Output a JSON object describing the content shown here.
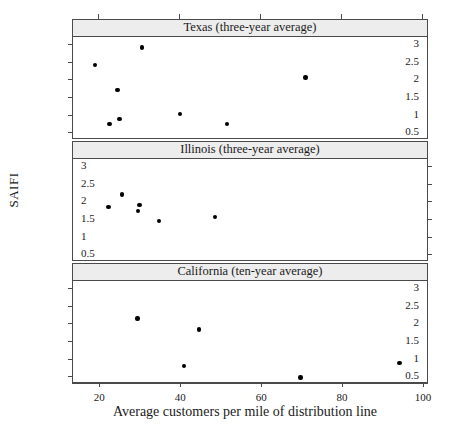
{
  "figure": {
    "ylabel": "SAIFI",
    "xlabel": "Average customers per mile of distribution line"
  },
  "chart_data": {
    "type": "scatter",
    "title": "",
    "xlabel": "Average customers per mile of distribution line",
    "ylabel": "SAIFI",
    "xlim": [
      13.5,
      101
    ],
    "ylim": [
      0.28,
      3.2
    ],
    "xticks": [
      20,
      40,
      60,
      80,
      100
    ],
    "yticks": [
      0.5,
      1,
      1.5,
      2,
      2.5,
      3
    ],
    "xtick_labels": [
      "20",
      "40",
      "60",
      "80",
      "100"
    ],
    "ytick_labels": [
      "0.5",
      "1",
      "1.5",
      "2",
      "2.5",
      "3"
    ],
    "grid": false,
    "legend": null,
    "marker": "filled-circle",
    "marker_color": "#000000",
    "layout": "trellis-3-rows-1-col",
    "panels": [
      {
        "label": "Texas (three-year average)",
        "axis_side": "left",
        "points": [
          {
            "x": 19.0,
            "y": 2.41
          },
          {
            "x": 22.5,
            "y": 0.73
          },
          {
            "x": 24.5,
            "y": 1.69
          },
          {
            "x": 25.0,
            "y": 0.87
          },
          {
            "x": 30.5,
            "y": 2.9
          },
          {
            "x": 40.0,
            "y": 1.02
          },
          {
            "x": 51.5,
            "y": 0.74
          },
          {
            "x": 71.0,
            "y": 2.05
          }
        ]
      },
      {
        "label": "Illinois (three-year average)",
        "axis_side": "right",
        "points": [
          {
            "x": 22.3,
            "y": 1.84
          },
          {
            "x": 25.6,
            "y": 2.19
          },
          {
            "x": 29.9,
            "y": 1.89
          },
          {
            "x": 29.6,
            "y": 1.73
          },
          {
            "x": 34.7,
            "y": 1.44
          },
          {
            "x": 48.6,
            "y": 1.55
          }
        ]
      },
      {
        "label": "California (ten-year average)",
        "axis_side": "left",
        "points": [
          {
            "x": 29.4,
            "y": 2.14
          },
          {
            "x": 41.0,
            "y": 0.79
          },
          {
            "x": 44.7,
            "y": 1.83
          },
          {
            "x": 69.7,
            "y": 0.46
          },
          {
            "x": 94.2,
            "y": 0.88
          }
        ]
      }
    ]
  }
}
